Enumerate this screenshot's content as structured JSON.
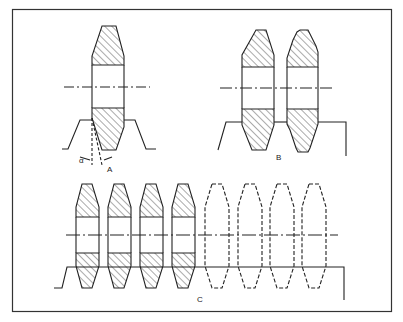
{
  "figure": {
    "panels": [
      {
        "id": "A",
        "label": "A",
        "angle_label": "α",
        "description": "Single hatched gear section with tapered profile and angle annotation"
      },
      {
        "id": "B",
        "label": "B",
        "description": "Two gear sections side by side; second with serrated (stepped) profile"
      },
      {
        "id": "C",
        "label": "C",
        "description": "Row of four hatched gear sections followed by four dashed outline sections"
      }
    ],
    "colors": {
      "line": "#222222",
      "hatch": "#555555",
      "background": "#ffffff"
    }
  }
}
